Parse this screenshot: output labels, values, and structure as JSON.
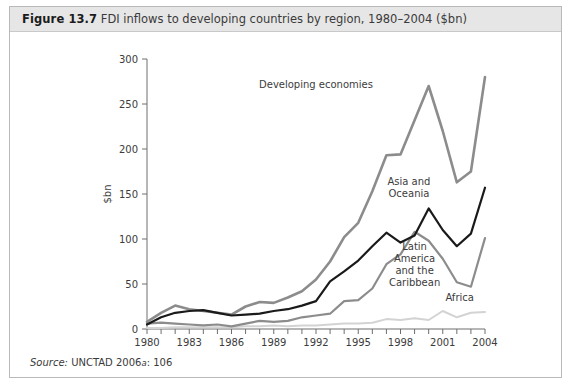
{
  "figure": {
    "number": "Figure 13.7",
    "caption": "FDI inflows to developing countries by region, 1980–2004 ($bn)",
    "source_label": "Source:",
    "source_text": "UNCTAD 2006",
    "source_sup": "a",
    "source_page": ": 106"
  },
  "chart_data": {
    "type": "line",
    "title": "FDI inflows to developing countries by region, 1980–2004 ($bn)",
    "xlabel": "Year",
    "ylabel": "$bn",
    "xlim": [
      1980,
      2004
    ],
    "ylim": [
      0,
      300
    ],
    "yticks": [
      0,
      50,
      100,
      150,
      200,
      250,
      300
    ],
    "xticks": [
      1980,
      1981,
      1982,
      1983,
      1984,
      1985,
      1986,
      1987,
      1988,
      1989,
      1990,
      1991,
      1992,
      1993,
      1994,
      1995,
      1996,
      1997,
      1998,
      1999,
      2000,
      2001,
      2002,
      2003,
      2004
    ],
    "xtick_labels": [
      1980,
      1983,
      1986,
      1989,
      1992,
      1995,
      1998,
      2001,
      2004
    ],
    "grid": false,
    "legend": "inline-annotations",
    "x": [
      1980,
      1981,
      1982,
      1983,
      1984,
      1985,
      1986,
      1987,
      1988,
      1989,
      1990,
      1991,
      1992,
      1993,
      1994,
      1995,
      1996,
      1997,
      1998,
      1999,
      2000,
      2001,
      2002,
      2003,
      2004
    ],
    "series": [
      {
        "name": "Developing economies",
        "color": "#8c8c8c",
        "width": 2.6,
        "label_x": 1992.0,
        "label_y": 268,
        "values": [
          8,
          18,
          26,
          22,
          20,
          18,
          16,
          25,
          30,
          29,
          35,
          42,
          55,
          75,
          102,
          118,
          153,
          193,
          194,
          232,
          270,
          220,
          163,
          175,
          280
        ]
      },
      {
        "name": "Asia and Oceania",
        "color": "#1a1a1a",
        "width": 2.2,
        "label_lines": [
          "Asia and",
          "Oceania"
        ],
        "label_x": 1998.6,
        "label_y": 160,
        "values": [
          5,
          13,
          18,
          20,
          21,
          18,
          15,
          16,
          17,
          20,
          22,
          26,
          31,
          53,
          64,
          76,
          92,
          107,
          96,
          104,
          134,
          110,
          92,
          106,
          157
        ]
      },
      {
        "name": "Latin America and the Caribbean",
        "color": "#8c8c8c",
        "width": 2.2,
        "label_lines": [
          "Latin",
          "America",
          "and the",
          "Caribbean"
        ],
        "label_x": 1999.0,
        "label_y": 88,
        "values": [
          6,
          7,
          6,
          5,
          4,
          5,
          3,
          6,
          9,
          8,
          9,
          13,
          15,
          17,
          31,
          32,
          45,
          72,
          83,
          108,
          98,
          78,
          52,
          47,
          101
        ]
      },
      {
        "name": "Africa",
        "color": "#d3d3d3",
        "width": 2.0,
        "label_x": 2002.2,
        "label_y": 31,
        "values": [
          1,
          1,
          2,
          2,
          2,
          2,
          2,
          3,
          3,
          4,
          3,
          4,
          4,
          5,
          6,
          6,
          7,
          11,
          10,
          12,
          10,
          20,
          13,
          18,
          19
        ]
      }
    ]
  }
}
